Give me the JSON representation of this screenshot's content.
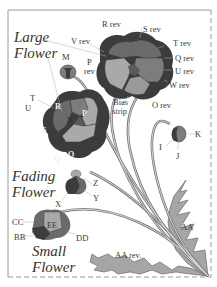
{
  "diagram": {
    "titles": {
      "large_flower": [
        "Large",
        "Flower"
      ],
      "fading_flower": [
        "Fading",
        "Flower"
      ],
      "small_flower": [
        "Small",
        "Flower"
      ]
    },
    "labels": {
      "r_rev": "R rev",
      "s_rev": "S rev",
      "t_rev": "T rev",
      "q_rev": "Q rev",
      "u_rev": "U rev",
      "w_rev": "W rev",
      "v_rev": "V rev",
      "p_rev": [
        "P",
        "rev"
      ],
      "m": "M",
      "o_rev": "O rev",
      "bias_strip": [
        "Bias",
        "strip"
      ],
      "t": "T",
      "u": "U",
      "r": "R",
      "s": "S",
      "v": "V",
      "w": "W",
      "p": "P",
      "q": "Q",
      "o": "O",
      "k": "K",
      "i": "I",
      "j": "J",
      "z": "Z",
      "y": "Y",
      "x": "X",
      "cc": "CC",
      "ee": "EE",
      "bb": "BB",
      "dd": "DD",
      "aa": "AA",
      "aa_rev": "AA rev."
    },
    "colors": {
      "darkest": "#3c3c3c",
      "dark": "#5a5a5a",
      "mid": "#7d7d7d",
      "light": "#a9a9a9",
      "leaf": "#a6a6a6",
      "frame": "#9a9a9a",
      "stem": "#8a8a8a"
    }
  }
}
